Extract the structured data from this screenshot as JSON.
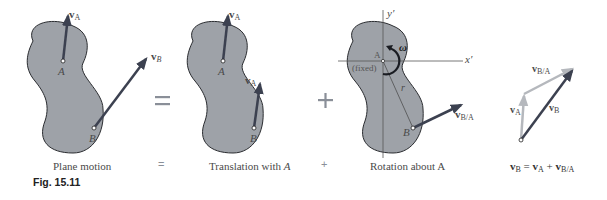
{
  "figure": {
    "caption": "Fig. 15.11",
    "colors": {
      "body_fill": "#9ea2a8",
      "body_stroke": "#2a2c30",
      "vector_dark": "#3c4150",
      "vector_light": "#b5b8bd",
      "text": "#4a4a4a"
    }
  },
  "panels": [
    {
      "id": "plane-motion",
      "label": "Plane motion",
      "points": {
        "A": "A",
        "B": "B"
      },
      "vectors": {
        "vA": "v",
        "vA_sub": "A",
        "vB": "v",
        "vB_sub": "B"
      }
    },
    {
      "id": "translation",
      "label": "Translation with A",
      "label_plain": "Translation with ",
      "label_italic": "A",
      "points": {
        "A": "A",
        "B": "B"
      },
      "vectors": {
        "vA_at_A": "v",
        "vA_at_A_sub": "A",
        "vA_at_B": "v",
        "vA_at_B_sub": "A"
      }
    },
    {
      "id": "rotation",
      "label": "Rotation about A",
      "points": {
        "A": "A",
        "B": "B"
      },
      "axes": {
        "x": "x′",
        "y": "y′"
      },
      "fixed_label": "(fixed)",
      "omega": "ω",
      "radius": "r",
      "vectors": {
        "vBA": "v",
        "vBA_sub": "B/A"
      }
    },
    {
      "id": "vector-triangle",
      "vectors": {
        "vA": "v",
        "vA_sub": "A",
        "vB": "v",
        "vB_sub": "B",
        "vBA": "v",
        "vBA_sub": "B/A"
      },
      "equation": {
        "lhs": "v",
        "lhs_sub": "B",
        "eq": " = ",
        "t1": "v",
        "t1_sub": "A",
        "plus": " + ",
        "t2": "v",
        "t2_sub": "B/A"
      }
    }
  ],
  "operators": {
    "equals": "=",
    "plus": "+",
    "equals_small": "=",
    "plus_small": "+"
  }
}
